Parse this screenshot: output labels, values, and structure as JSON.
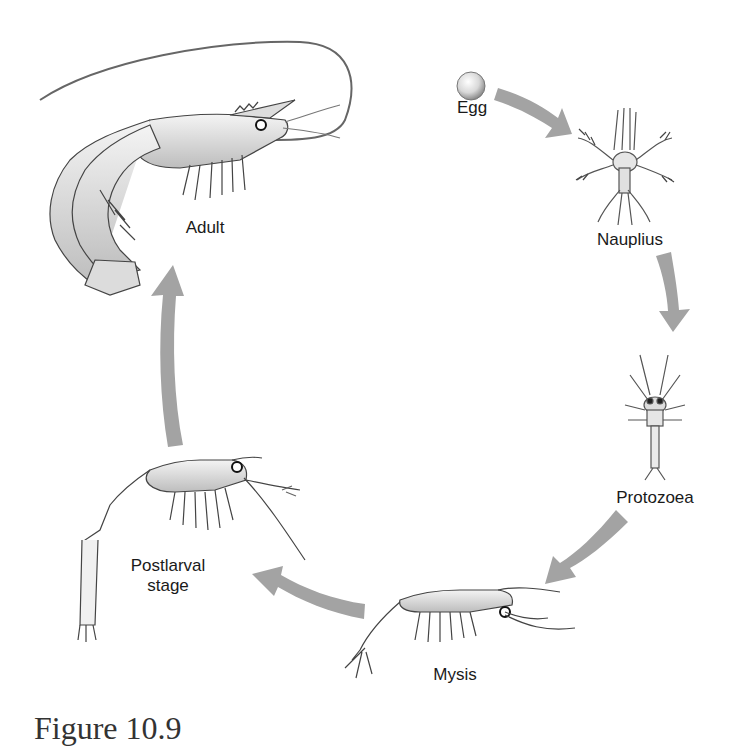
{
  "figure": {
    "caption": "Figure 10.9",
    "arrow_color": "#a0a0a0",
    "stages": [
      {
        "id": "egg",
        "label": "Egg"
      },
      {
        "id": "nauplius",
        "label": "Nauplius"
      },
      {
        "id": "protozoea",
        "label": "Protozoea"
      },
      {
        "id": "mysis",
        "label": "Mysis"
      },
      {
        "id": "postlarval",
        "label": "Postlarval",
        "label_line2": "stage"
      },
      {
        "id": "adult",
        "label": "Adult"
      }
    ],
    "flow": [
      "Egg",
      "Nauplius",
      "Protozoea",
      "Mysis",
      "Postlarval stage",
      "Adult"
    ]
  }
}
